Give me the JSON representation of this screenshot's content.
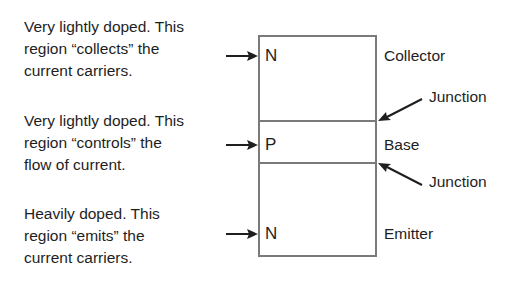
{
  "diagram": {
    "descriptions": [
      {
        "lines": [
          "Very lightly doped. This",
          "region “collects” the",
          "current carriers."
        ]
      },
      {
        "lines": [
          "Very lightly doped. This",
          "region “controls” the",
          "flow of current."
        ]
      },
      {
        "lines": [
          "Heavily doped. This",
          "region “emits” the",
          "current carriers."
        ]
      }
    ],
    "regions": [
      {
        "letter": "N",
        "label": "Collector"
      },
      {
        "letter": "P",
        "label": "Base"
      },
      {
        "letter": "N",
        "label": "Emitter"
      }
    ],
    "junctions": [
      {
        "label": "Junction"
      },
      {
        "label": "Junction"
      }
    ],
    "colors": {
      "text": "#1e1e1e",
      "box_border": "#7a7a7a",
      "background": "#ffffff"
    }
  }
}
